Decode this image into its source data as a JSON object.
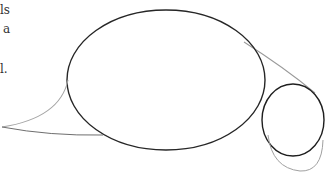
{
  "text_fragments": {
    "line1": "ls",
    "line2": "a",
    "line3": "l."
  },
  "sketch": {
    "description": "Pencil construction sketch: large oval body, small circle head, tapered tail guide lines",
    "stroke_dark": "#222222",
    "stroke_light": "#999999"
  }
}
